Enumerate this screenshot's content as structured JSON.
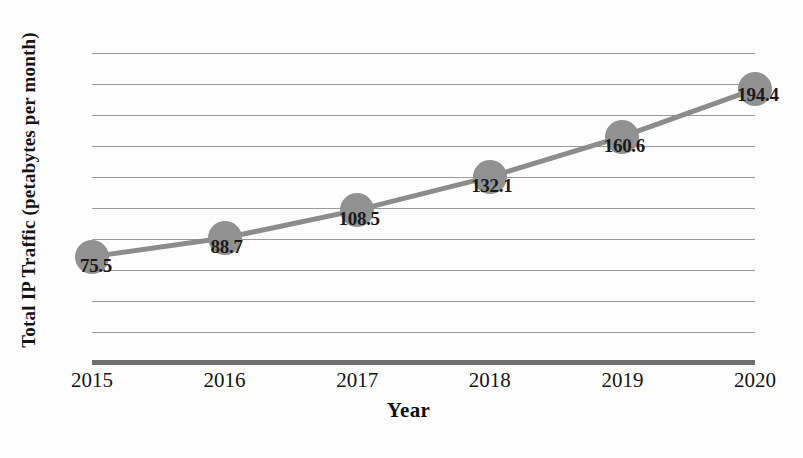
{
  "chart_data": {
    "type": "line",
    "title": "",
    "xlabel": "Year",
    "ylabel": "Total IP Traffic (petabytes per month)",
    "categories": [
      "2015",
      "2016",
      "2017",
      "2018",
      "2019",
      "2020"
    ],
    "values": [
      75.5,
      88.7,
      108.5,
      132.1,
      160.6,
      194.4
    ],
    "point_labels": [
      "75.5",
      "88.7",
      "108.5",
      "132.1",
      "160.6",
      "194.4"
    ],
    "series": [
      {
        "name": "Total IP Traffic",
        "values": [
          75.5,
          88.7,
          108.5,
          132.1,
          160.6,
          194.4
        ]
      }
    ],
    "ylim": [
      0,
      220
    ],
    "ytick_count": 11,
    "ytick_labels_shown": false,
    "grid": true,
    "grid_axis": "y",
    "legend": false,
    "legend_position": "none",
    "marker": "circle",
    "line_color": "#8c8c8c",
    "marker_color": "#919191",
    "gridline_color": "#9a9a9a",
    "axis_color": "#6f6f6f",
    "label_color": "#1a1a1a",
    "background": "#fdfdfd"
  }
}
